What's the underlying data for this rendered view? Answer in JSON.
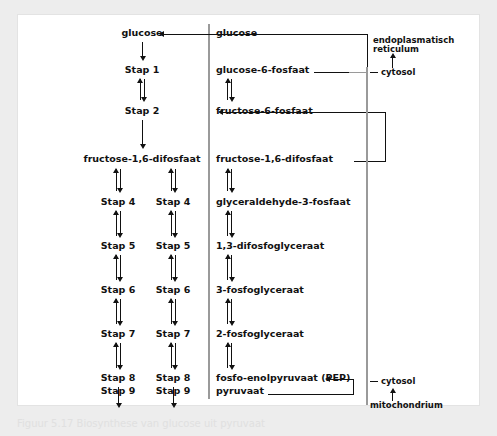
{
  "figure": {
    "caption": "Figuur 5.17  Biosynthese van glucose uit pyruvaat",
    "background_color": "#ededed",
    "panel_color": "#ffffff",
    "line_color": "#111111",
    "membrane_color": "#9a9a9a"
  },
  "left_panel": {
    "top_node": "glucose",
    "shared_node": "fructose-1,6-difosfaat",
    "steps": {
      "step1": "Stap 1",
      "step2": "Stap 2",
      "step4": "Stap 4",
      "step5": "Stap 5",
      "step6": "Stap 6",
      "step7": "Stap 7",
      "step8": "Stap 8",
      "step9": "Stap 9"
    }
  },
  "right_panel": {
    "metabolites": [
      "glucose",
      "glucose-6-fosfaat",
      "fructose-6-fosfaat",
      "fructose-1,6-difosfaat",
      "glyceraldehyde-3-fosfaat",
      "1,3-difosfoglyceraat",
      "3-fosfoglyceraat",
      "2-fosfoglyceraat",
      "fosfo-enolpyruvaat (PEP)",
      "pyruvaat"
    ],
    "compartments": {
      "er": "endoplasmatisch\nreticulum",
      "er_line1": "endoplasmatisch",
      "er_line2": "reticulum",
      "cytosol_top": "cytosol",
      "cytosol_bottom": "cytosol",
      "mitochondrium": "mitochondrium"
    }
  }
}
